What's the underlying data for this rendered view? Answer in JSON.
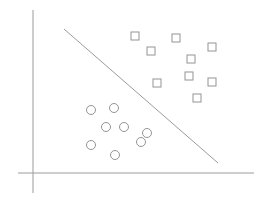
{
  "canvas": {
    "width": 267,
    "height": 206,
    "background": "#ffffff"
  },
  "chart_data": {
    "type": "scatter",
    "title": "",
    "xlabel": "",
    "ylabel": "",
    "tick_labels": [],
    "legend": null,
    "grid": false,
    "colors": {
      "axis_stroke": "#9b9b9b",
      "boundary_stroke": "#9b9b9b",
      "marker_stroke": "#949494",
      "marker_fill": "#ffffff"
    },
    "stroke_width": 1,
    "axes": {
      "y_axis_px": {
        "x1": 33,
        "y1": 10,
        "x2": 33,
        "y2": 193
      },
      "x_axis_px": {
        "x1": 18,
        "y1": 173,
        "x2": 254,
        "y2": 173
      }
    },
    "boundary_line_px": {
      "x1": 64,
      "y1": 29,
      "x2": 218,
      "y2": 163
    },
    "series": [
      {
        "name": "class-circles",
        "marker": "circle",
        "marker_radius": 4.5,
        "points_px": [
          [
            91,
            110
          ],
          [
            114,
            108
          ],
          [
            106,
            127
          ],
          [
            124,
            127
          ],
          [
            147,
            133
          ],
          [
            91,
            145
          ],
          [
            141,
            142
          ],
          [
            115,
            155
          ]
        ]
      },
      {
        "name": "class-squares",
        "marker": "square",
        "marker_size": 8,
        "points_px": [
          [
            135,
            36
          ],
          [
            176,
            38
          ],
          [
            212,
            47
          ],
          [
            151,
            51
          ],
          [
            191,
            59
          ],
          [
            189,
            76
          ],
          [
            157,
            83
          ],
          [
            212,
            82
          ],
          [
            197,
            98
          ]
        ]
      }
    ]
  }
}
